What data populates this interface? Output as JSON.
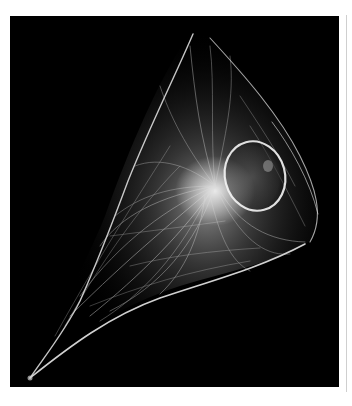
{
  "figure": {
    "background_color": "#000000",
    "page_color": "#ffffff",
    "signal_color": "#f2f2f2",
    "frame_line_color": "#cfcfcf"
  }
}
